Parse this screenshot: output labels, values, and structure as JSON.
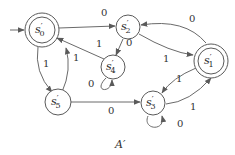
{
  "diagram": {
    "caption": "A′",
    "start_state": "s0",
    "nodes": [
      {
        "id": "s0",
        "name": "s",
        "sub": "0",
        "prime": "′",
        "accepting": true
      },
      {
        "id": "s1",
        "name": "s",
        "sub": "1",
        "prime": "′",
        "accepting": true
      },
      {
        "id": "s2",
        "name": "s",
        "sub": "2",
        "prime": "′",
        "accepting": false
      },
      {
        "id": "s3",
        "name": "s",
        "sub": "3",
        "prime": "′",
        "accepting": false
      },
      {
        "id": "s4",
        "name": "s",
        "sub": "4",
        "prime": "′",
        "accepting": false
      },
      {
        "id": "s5",
        "name": "s",
        "sub": "5",
        "prime": "′",
        "accepting": false
      }
    ],
    "edges": [
      {
        "from": "s0",
        "to": "s2",
        "label": "0"
      },
      {
        "from": "s4",
        "to": "s0",
        "label": "1"
      },
      {
        "from": "s2",
        "to": "s4",
        "label": "0"
      },
      {
        "from": "s2",
        "to": "s1",
        "label": "1"
      },
      {
        "from": "s1",
        "to": "s2",
        "label": "0"
      },
      {
        "from": "s0",
        "to": "s5",
        "label": "1"
      },
      {
        "from": "s5",
        "to": "s0",
        "label": "1"
      },
      {
        "from": "s4",
        "to": "s4",
        "label": "0"
      },
      {
        "from": "s5",
        "to": "s3",
        "label": "0"
      },
      {
        "from": "s1",
        "to": "s3",
        "label": "1"
      },
      {
        "from": "s3",
        "to": "s1",
        "label": "1"
      },
      {
        "from": "s3",
        "to": "s3",
        "label": "0"
      }
    ]
  }
}
